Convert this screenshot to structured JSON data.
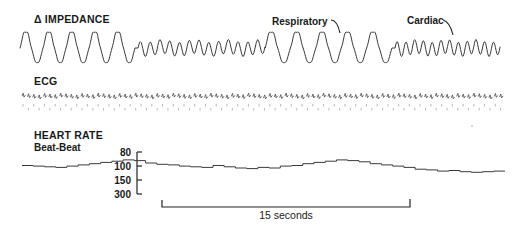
{
  "chart_data": {
    "type": "line",
    "title": "",
    "panels": [
      {
        "name": "impedance",
        "label": "Δ IMPEDANCE",
        "annotations": [
          {
            "text": "Respiratory",
            "target": "large-amplitude respiratory waves"
          },
          {
            "text": "Cardiac",
            "target": "small-amplitude cardiac waves"
          }
        ],
        "segments": [
          {
            "component": "respiratory",
            "cycles": 5
          },
          {
            "component": "cardiac",
            "cycles": 13
          },
          {
            "component": "respiratory",
            "cycles": 5
          },
          {
            "component": "cardiac",
            "cycles": 12
          }
        ]
      },
      {
        "name": "ecg",
        "label": "ECG",
        "beats": 90
      },
      {
        "name": "heart_rate",
        "label": "HEART RATE",
        "sublabel": "Beat-Beat",
        "ylabel": "beats/min",
        "yticks": [
          80,
          100,
          150,
          300
        ],
        "y_scale": "reciprocal (beat interval)",
        "ylim": [
          80,
          300
        ],
        "series": [
          {
            "name": "Beat-Beat heart rate",
            "values": [
              104,
              103,
              102,
              101,
              103,
              105,
              107,
              109,
              111,
              113,
              112,
              108,
              106,
              105,
              103,
              102,
              101,
              104,
              102,
              100,
              99,
              101,
              100,
              103,
              104,
              107,
              109,
              111,
              113,
              112,
              110,
              107,
              105,
              103,
              101,
              98,
              97,
              95,
              96,
              94,
              93,
              94,
              95
            ]
          }
        ]
      }
    ],
    "scale_bar": {
      "label": "15 seconds",
      "duration_s": 15
    },
    "grid": false,
    "legend": "none"
  },
  "labels": {
    "impedance": "Δ IMPEDANCE",
    "respiratory": "Respiratory",
    "cardiac": "Cardiac",
    "ecg": "ECG",
    "heart_rate": "HEART RATE",
    "beat_beat": "Beat-Beat",
    "tick_80": "80",
    "tick_100": "100",
    "tick_150": "150",
    "tick_300": "300",
    "scale": "15 seconds"
  }
}
